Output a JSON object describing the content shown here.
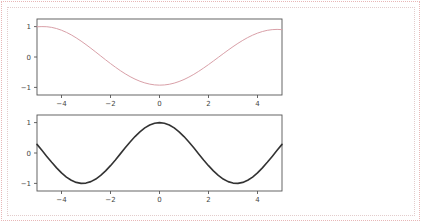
{
  "page": {
    "background": "#ffffff",
    "outer_border_color": "#e8b7b7",
    "inner_border_color": "#e3cccc"
  },
  "chart_data": [
    {
      "id": "top",
      "type": "line",
      "title": "",
      "xlabel": "",
      "ylabel": "",
      "xlim": [
        -5.0,
        5.0
      ],
      "ylim": [
        -1.25,
        1.25
      ],
      "xticks": [
        -4,
        -2,
        0,
        2,
        4
      ],
      "xticklabels": [
        "−4",
        "−2",
        "0",
        "2",
        "4"
      ],
      "yticks": [
        -1,
        0,
        1
      ],
      "yticklabels": [
        "−1",
        "0",
        "1"
      ],
      "grid": false,
      "legend": null,
      "series": [
        {
          "name": "cos(x - 1.6)",
          "color": "#d9a0a8",
          "linewidth": 1.0,
          "x": [
            -5.0,
            -4.8,
            -4.6,
            -4.4,
            -4.2,
            -4.0,
            -3.8,
            -3.6,
            -3.4,
            -3.2,
            -3.0,
            -2.8,
            -2.6,
            -2.4,
            -2.2,
            -2.0,
            -1.8,
            -1.6,
            -1.4,
            -1.2,
            -1.0,
            -0.8,
            -0.6,
            -0.4,
            -0.2,
            0.0,
            0.2,
            0.4,
            0.6,
            0.8,
            1.0,
            1.2,
            1.4,
            1.6,
            1.8,
            2.0,
            2.2,
            2.4,
            2.6,
            2.8,
            3.0,
            3.2,
            3.4,
            3.6,
            3.8,
            4.0,
            4.2,
            4.4,
            4.6,
            4.8,
            5.0
          ],
          "y": [
            0.994,
            1.0,
            0.996,
            0.974,
            0.936,
            0.881,
            0.811,
            0.727,
            0.63,
            0.523,
            0.408,
            0.287,
            0.162,
            0.035,
            -0.092,
            -0.216,
            -0.335,
            -0.448,
            -0.552,
            -0.646,
            -0.728,
            -0.797,
            -0.852,
            -0.892,
            -0.917,
            -0.926,
            -0.919,
            -0.897,
            -0.859,
            -0.806,
            -0.74,
            -0.661,
            -0.571,
            -0.471,
            -0.363,
            -0.25,
            -0.132,
            -0.012,
            0.108,
            0.226,
            0.34,
            0.448,
            0.548,
            0.639,
            0.718,
            0.785,
            0.838,
            0.877,
            0.9,
            0.908,
            0.9
          ]
        }
      ]
    },
    {
      "id": "bottom",
      "type": "line",
      "title": "",
      "xlabel": "",
      "ylabel": "",
      "xlim": [
        -5.0,
        5.0
      ],
      "ylim": [
        -1.25,
        1.25
      ],
      "xticks": [
        -4,
        -2,
        0,
        2,
        4
      ],
      "xticklabels": [
        "−4",
        "−2",
        "0",
        "2",
        "4"
      ],
      "yticks": [
        -1,
        0,
        1
      ],
      "yticklabels": [
        "−1",
        "0",
        "1"
      ],
      "grid": false,
      "legend": null,
      "series": [
        {
          "name": "cos(x)",
          "color": "#333333",
          "linewidth": 1.6,
          "x": [
            -5.0,
            -4.8,
            -4.6,
            -4.4,
            -4.2,
            -4.0,
            -3.8,
            -3.6,
            -3.4,
            -3.2,
            -3.0,
            -2.8,
            -2.6,
            -2.4,
            -2.2,
            -2.0,
            -1.8,
            -1.6,
            -1.4,
            -1.2,
            -1.0,
            -0.8,
            -0.6,
            -0.4,
            -0.2,
            0.0,
            0.2,
            0.4,
            0.6,
            0.8,
            1.0,
            1.2,
            1.4,
            1.6,
            1.8,
            2.0,
            2.2,
            2.4,
            2.6,
            2.8,
            3.0,
            3.2,
            3.4,
            3.6,
            3.8,
            4.0,
            4.2,
            4.4,
            4.6,
            4.8,
            5.0
          ],
          "y": [
            0.284,
            0.087,
            -0.112,
            -0.307,
            -0.49,
            -0.654,
            -0.791,
            -0.897,
            -0.967,
            -0.998,
            -0.99,
            -0.942,
            -0.857,
            -0.737,
            -0.589,
            -0.416,
            -0.227,
            -0.029,
            0.17,
            0.362,
            0.54,
            0.697,
            0.825,
            0.921,
            0.98,
            1.0,
            0.98,
            0.921,
            0.825,
            0.697,
            0.54,
            0.362,
            0.17,
            -0.029,
            -0.227,
            -0.416,
            -0.589,
            -0.737,
            -0.857,
            -0.942,
            -0.99,
            -0.998,
            -0.967,
            -0.897,
            -0.791,
            -0.654,
            -0.49,
            -0.307,
            -0.112,
            0.087,
            0.284
          ]
        }
      ]
    }
  ]
}
